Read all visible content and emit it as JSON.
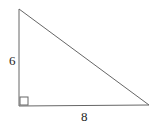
{
  "diagram": {
    "type": "right-triangle",
    "vertices": {
      "top": [
        19,
        9
      ],
      "right_angle": [
        19,
        106
      ],
      "right": [
        149,
        105
      ]
    },
    "labels": {
      "vertical_leg": "6",
      "horizontal_leg": "8"
    },
    "right_angle_marker": true,
    "stroke_color": "#555555"
  }
}
